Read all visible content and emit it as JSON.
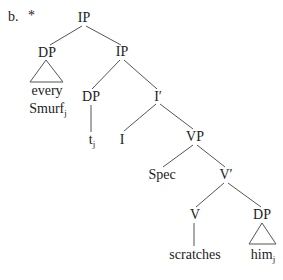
{
  "example": {
    "label": "b.",
    "mark": "*"
  },
  "nodes": {
    "ip_root": "IP",
    "dp_subject": "DP",
    "every": "every",
    "smurf": "Smurf",
    "smurf_index": "j",
    "ip_mid": "IP",
    "dp_trace": "DP",
    "trace": "t",
    "trace_index": "j",
    "i_bar": "I′",
    "i_head": "I",
    "vp": "VP",
    "spec": "Spec",
    "v_bar": "V′",
    "v_head": "V",
    "dp_object": "DP",
    "scratches": "scratches",
    "him": "him",
    "him_index": "j"
  },
  "colors": {
    "text": "#222222",
    "lines": "#555555",
    "background": "#ffffff"
  }
}
